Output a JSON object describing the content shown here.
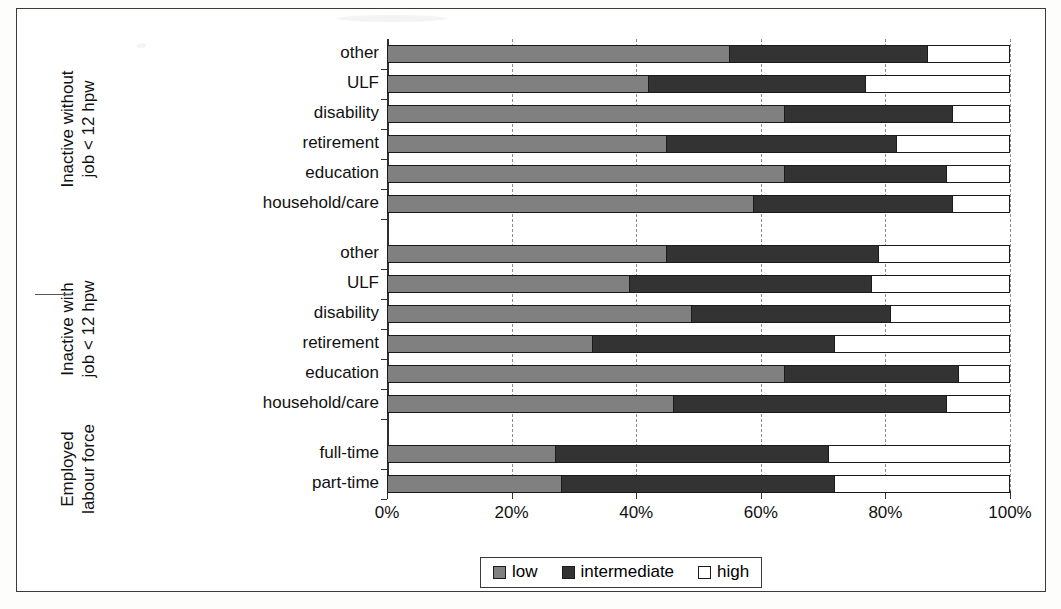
{
  "chart_data": {
    "type": "bar",
    "orientation": "horizontal",
    "stacked": true,
    "normalized": true,
    "title": "",
    "xlabel": "",
    "ylabel": "",
    "xlim": [
      0,
      100
    ],
    "xticks": [
      "0%",
      "20%",
      "40%",
      "60%",
      "80%",
      "100%"
    ],
    "xtick_values": [
      0,
      20,
      40,
      60,
      80,
      100
    ],
    "grid": "vertical-dashed",
    "legend_position": "bottom-center",
    "legend": [
      "low",
      "intermediate",
      "high"
    ],
    "series": [
      {
        "name": "low",
        "color": "#808080"
      },
      {
        "name": "intermediate",
        "color": "#333333"
      },
      {
        "name": "high",
        "color": "#ffffff"
      }
    ],
    "groups": [
      {
        "label_lines": [
          "Inactive without",
          "job < 12 hpw"
        ],
        "categories": [
          "other",
          "ULF",
          "disability",
          "retirement",
          "education",
          "household/care"
        ],
        "rows": [
          {
            "category": "other",
            "low": 55,
            "intermediate": 32,
            "high": 13
          },
          {
            "category": "ULF",
            "low": 42,
            "intermediate": 35,
            "high": 23
          },
          {
            "category": "disability",
            "low": 64,
            "intermediate": 27,
            "high": 9
          },
          {
            "category": "retirement",
            "low": 45,
            "intermediate": 37,
            "high": 18
          },
          {
            "category": "education",
            "low": 64,
            "intermediate": 26,
            "high": 10
          },
          {
            "category": "household/care",
            "low": 59,
            "intermediate": 32,
            "high": 9
          }
        ]
      },
      {
        "label_lines": [
          "Inactive with",
          "job < 12 hpw"
        ],
        "categories": [
          "other",
          "ULF",
          "disability",
          "retirement",
          "education",
          "household/care"
        ],
        "rows": [
          {
            "category": "other",
            "low": 45,
            "intermediate": 34,
            "high": 21
          },
          {
            "category": "ULF",
            "low": 39,
            "intermediate": 39,
            "high": 22
          },
          {
            "category": "disability",
            "low": 49,
            "intermediate": 32,
            "high": 19
          },
          {
            "category": "retirement",
            "low": 33,
            "intermediate": 39,
            "high": 28
          },
          {
            "category": "education",
            "low": 64,
            "intermediate": 28,
            "high": 8
          },
          {
            "category": "household/care",
            "low": 46,
            "intermediate": 44,
            "high": 10
          }
        ]
      },
      {
        "label_lines": [
          "Employed",
          "labour force"
        ],
        "categories": [
          "full-time",
          "part-time"
        ],
        "rows": [
          {
            "category": "full-time",
            "low": 27,
            "intermediate": 44,
            "high": 29
          },
          {
            "category": "part-time",
            "low": 28,
            "intermediate": 44,
            "high": 28
          }
        ]
      }
    ]
  }
}
